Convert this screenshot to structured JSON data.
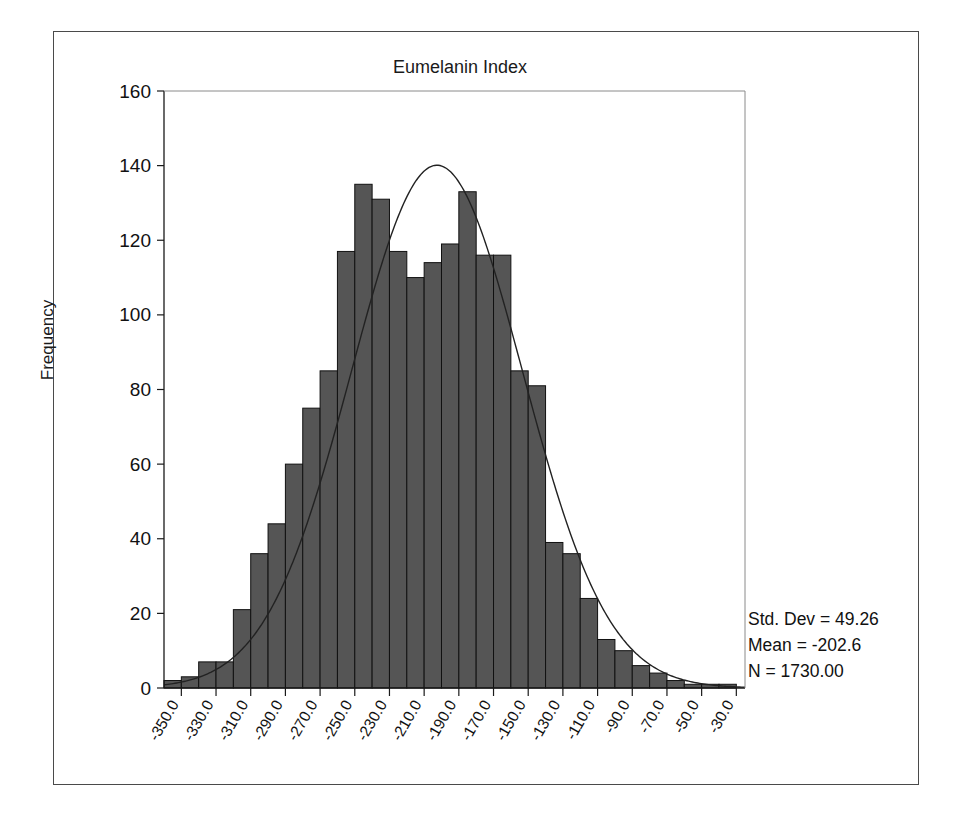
{
  "chart_data": {
    "type": "bar",
    "title": "Eumelanin Index",
    "xlabel": "",
    "ylabel": "Frequency",
    "ylim": [
      0,
      160
    ],
    "ytick_step": 20,
    "yticks": [
      0,
      20,
      40,
      60,
      80,
      100,
      120,
      140,
      160
    ],
    "ytick_labels": [
      "0",
      "20",
      "40",
      "60",
      "80",
      "100",
      "120",
      "140",
      "160"
    ],
    "xlim": [
      -360,
      -25
    ],
    "xtick_labels": [
      "-350.0",
      "-330.0",
      "-310.0",
      "-290.0",
      "-270.0",
      "-250.0",
      "-230.0",
      "-210.0",
      "-190.0",
      "-170.0",
      "-150.0",
      "-130.0",
      "-110.0",
      "-90.0",
      "-70.0",
      "-50.0",
      "-30.0"
    ],
    "xticks": [
      -350,
      -330,
      -310,
      -290,
      -270,
      -250,
      -230,
      -210,
      -190,
      -170,
      -150,
      -130,
      -110,
      -90,
      -70,
      -50,
      -30
    ],
    "xtick_rotation_deg": -60,
    "bin_width": 10,
    "bin_centers": [
      -355,
      -345,
      -335,
      -325,
      -315,
      -305,
      -295,
      -285,
      -275,
      -265,
      -255,
      -245,
      -235,
      -225,
      -215,
      -205,
      -195,
      -185,
      -175,
      -165,
      -155,
      -145,
      -135,
      -125,
      -115,
      -105,
      -95,
      -85,
      -75,
      -65,
      -55,
      -45,
      -35
    ],
    "values": [
      2,
      3,
      7,
      7,
      21,
      36,
      44,
      60,
      75,
      85,
      117,
      135,
      131,
      117,
      110,
      114,
      119,
      133,
      116,
      116,
      85,
      81,
      39,
      36,
      24,
      13,
      10,
      6,
      4,
      2,
      1,
      1,
      1
    ],
    "grid": false,
    "legend": false,
    "bar_color": "#555555",
    "bar_edge_color": "#111111",
    "curve": {
      "label": "normal-distribution-curve",
      "color": "#222222",
      "peak_value": 140,
      "mean": -202.6,
      "std_dev": 49.26,
      "n": 1730,
      "bin_width": 10
    },
    "annotations": {
      "std_dev": "Std. Dev = 49.26",
      "mean": "Mean = -202.6",
      "n": "N = 1730.00"
    }
  },
  "axis": {
    "y_title": "Frequency"
  },
  "colors": {
    "frame": "#4a4a4a",
    "axis": "#1a1a1a",
    "bar_fill": "#555555",
    "bar_edge": "#111111",
    "curve": "#222222",
    "text": "#111111"
  }
}
